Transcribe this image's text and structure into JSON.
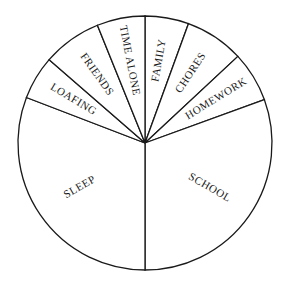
{
  "chart_data": {
    "type": "pie",
    "title": "",
    "units": "degrees (estimated from spoke angles)",
    "start_angle_deg": 0,
    "direction": "clockwise from top",
    "categories": [
      "FAMILY",
      "CHORES",
      "HOMEWORK",
      "SCHOOL",
      "SLEEP",
      "LOAFING",
      "FRIENDS",
      "TIME ALONE"
    ],
    "values": [
      20,
      27,
      23,
      110,
      111,
      20,
      27,
      22
    ],
    "label_placement": "inside, rotated radially",
    "legend": "none",
    "colors": {
      "fill": "#ffffff",
      "stroke": "#1a1a1a",
      "text": "#1a1a1a"
    }
  },
  "layout": {
    "cx": 145,
    "cy": 143,
    "r": 127
  }
}
